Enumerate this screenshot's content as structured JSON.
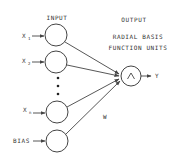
{
  "diagram": {
    "title_input": "INPUT",
    "title_output": "OUTPUT",
    "rbf_label_line1": "RADIAL BASIS",
    "rbf_label_line2": "FUNCTION UNITS",
    "inputs": [
      {
        "base": "X",
        "sub": "1"
      },
      {
        "base": "X",
        "sub": "2"
      },
      {
        "base": "X",
        "sub": "n"
      }
    ],
    "bias_label": "BIAS",
    "ellipsis": "•••",
    "output_node_symbol": "Λ",
    "output_label": "Y",
    "weight_label": "W",
    "colors": {
      "stroke": "#444444",
      "text": "#333333",
      "background": "#ffffff"
    }
  }
}
